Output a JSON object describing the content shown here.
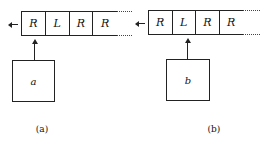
{
  "figure": {
    "panels": [
      {
        "id": "a",
        "tape_cells": [
          "R",
          "L",
          "R",
          "R"
        ],
        "box_label": "a",
        "caption": "(a)"
      },
      {
        "id": "b",
        "tape_cells": [
          "R",
          "L",
          "R",
          "R"
        ],
        "box_label": "b",
        "caption": "(b)"
      }
    ]
  }
}
